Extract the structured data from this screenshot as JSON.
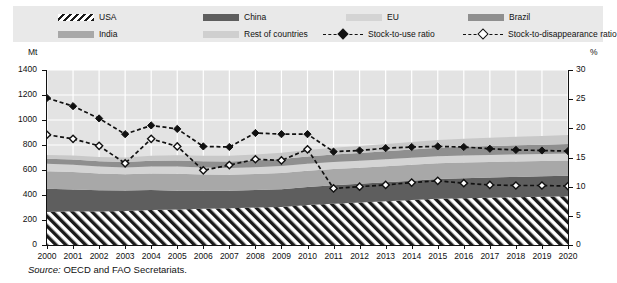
{
  "legend": {
    "items": [
      {
        "label": "USA",
        "kind": "area",
        "pattern": "hatch",
        "color": "#1a1a1a"
      },
      {
        "label": "China",
        "kind": "area",
        "pattern": "solid",
        "color": "#5e5e5e"
      },
      {
        "label": "EU",
        "kind": "area",
        "pattern": "solid",
        "color": "#d4d4d4"
      },
      {
        "label": "Brazil",
        "kind": "area",
        "pattern": "solid",
        "color": "#8f8f8f"
      },
      {
        "label": "India",
        "kind": "area",
        "pattern": "solid",
        "color": "#a8a8a8"
      },
      {
        "label": "Rest of countries",
        "kind": "area",
        "pattern": "solid",
        "color": "#c8c8c8"
      },
      {
        "label": "Stock-to-use ratio",
        "kind": "line",
        "marker": "solid-diamond",
        "color": "#111111"
      },
      {
        "label": "Stock-to-disappearance ratio",
        "kind": "line",
        "marker": "hollow-diamond",
        "color": "#111111"
      }
    ]
  },
  "axes": {
    "left_title": "Mt",
    "right_title": "%",
    "left_ticks": [
      "1400",
      "1200",
      "1000",
      "800",
      "600",
      "400",
      "200",
      "0"
    ],
    "right_ticks": [
      "30",
      "25",
      "20",
      "15",
      "10",
      "5",
      "0"
    ]
  },
  "source": {
    "prefix": "Source:",
    "text": "OECD and FAO Secretariats."
  },
  "chart_data": {
    "type": "area",
    "title": "",
    "subtitle": "",
    "xlabel": "",
    "ylabel": "Mt",
    "y2label": "%",
    "ylim": [
      0,
      1400
    ],
    "y2lim": [
      0,
      30
    ],
    "grid": true,
    "legend_position": "top",
    "stacking": "stacked",
    "stack_order_bottom_to_top": [
      "USA",
      "China",
      "India",
      "EU",
      "Brazil",
      "Rest of countries"
    ],
    "x": [
      2000,
      2001,
      2002,
      2003,
      2004,
      2005,
      2006,
      2007,
      2008,
      2009,
      2010,
      2011,
      2012,
      2013,
      2014,
      2015,
      2016,
      2017,
      2018,
      2019,
      2020
    ],
    "categories": [
      "2000",
      "2001",
      "2002",
      "2003",
      "2004",
      "2005",
      "2006",
      "2007",
      "2008",
      "2009",
      "2010",
      "2011",
      "2012",
      "2013",
      "2014",
      "2015",
      "2016",
      "2017",
      "2018",
      "2019",
      "2020"
    ],
    "series": [
      {
        "name": "USA",
        "axis": "left",
        "color": "#1a1a1a",
        "pattern": "diagonal-hatch",
        "values": [
          265,
          270,
          268,
          272,
          280,
          285,
          290,
          295,
          300,
          305,
          320,
          330,
          340,
          350,
          360,
          370,
          375,
          378,
          382,
          386,
          390
        ]
      },
      {
        "name": "China",
        "axis": "left",
        "color": "#5e5e5e",
        "values": [
          185,
          175,
          170,
          165,
          160,
          150,
          145,
          140,
          140,
          142,
          145,
          148,
          150,
          152,
          155,
          158,
          160,
          162,
          163,
          164,
          165
        ]
      },
      {
        "name": "India",
        "axis": "left",
        "color": "#a8a8a8",
        "values": [
          140,
          140,
          135,
          130,
          132,
          135,
          130,
          128,
          128,
          130,
          130,
          130,
          128,
          128,
          127,
          126,
          125,
          124,
          124,
          123,
          122
        ]
      },
      {
        "name": "EU",
        "axis": "left",
        "color": "#d4d4d4",
        "values": [
          60,
          58,
          56,
          54,
          56,
          58,
          55,
          54,
          55,
          56,
          56,
          56,
          56,
          56,
          56,
          56,
          56,
          56,
          56,
          56,
          56
        ]
      },
      {
        "name": "Brazil",
        "axis": "left",
        "color": "#8f8f8f",
        "values": [
          40,
          42,
          42,
          44,
          46,
          48,
          50,
          52,
          54,
          56,
          58,
          60,
          62,
          64,
          66,
          68,
          70,
          72,
          73,
          74,
          75
        ]
      },
      {
        "name": "Rest of countries",
        "axis": "left",
        "color": "#c8c8c8",
        "values": [
          30,
          32,
          34,
          36,
          40,
          42,
          44,
          46,
          48,
          50,
          52,
          54,
          56,
          58,
          60,
          62,
          64,
          66,
          68,
          70,
          72
        ]
      },
      {
        "name": "Stock-to-use ratio",
        "axis": "right",
        "color": "#111111",
        "marker": "solid-diamond",
        "linestyle": "dashed",
        "values": [
          25.2,
          23.8,
          21.7,
          19.0,
          20.5,
          19.9,
          16.9,
          16.8,
          19.2,
          19.0,
          19.0,
          16.0,
          16.2,
          16.6,
          16.8,
          16.9,
          16.8,
          16.5,
          16.3,
          16.2,
          16.1
        ]
      },
      {
        "name": "Stock-to-disappearance ratio",
        "axis": "right",
        "color": "#111111",
        "marker": "hollow-diamond",
        "linestyle": "dashed",
        "values": [
          18.9,
          18.2,
          17.0,
          14.0,
          18.2,
          16.9,
          12.8,
          13.7,
          14.7,
          14.5,
          16.4,
          9.7,
          10.0,
          10.3,
          10.7,
          11.0,
          10.6,
          10.3,
          10.2,
          10.2,
          10.1
        ]
      }
    ]
  }
}
